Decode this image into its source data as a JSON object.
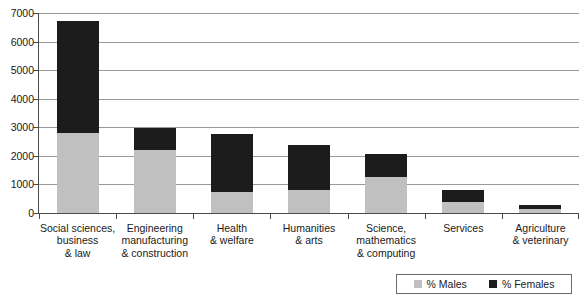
{
  "chart_data": {
    "type": "bar",
    "stacked": true,
    "title": "",
    "subtitle": "",
    "xlabel": "",
    "ylabel": "",
    "ylim": [
      0,
      7000
    ],
    "y_ticks": [
      0,
      1000,
      2000,
      3000,
      4000,
      5000,
      6000,
      7000
    ],
    "y_tick_labels": [
      "0",
      "1000",
      "2000",
      "3000",
      "4000",
      "5000",
      "6000",
      "7000"
    ],
    "grid": true,
    "grid_axis": "y",
    "legend_position": "bottom-right",
    "categories": [
      "Social sciences, business & law",
      "Engineering manufacturing & construction",
      "Health & welfare",
      "Humanities & arts",
      "Science, mathematics & computing",
      "Services",
      "Agriculture & veterinary"
    ],
    "category_label_lines": [
      [
        "Social sciences,",
        "business",
        "& law"
      ],
      [
        "Engineering",
        "manufacturing",
        "& construction"
      ],
      [
        "Health",
        "& welfare"
      ],
      [
        "Humanities",
        "& arts"
      ],
      [
        "Science,",
        "mathematics",
        "& computing"
      ],
      [
        "Services"
      ],
      [
        "Agriculture",
        "& veterinary"
      ]
    ],
    "series": [
      {
        "name": "% Males",
        "color": "#c0c0c0",
        "values": [
          2790,
          2210,
          740,
          800,
          1260,
          380,
          150
        ]
      },
      {
        "name": "% Females",
        "color": "#1c1c1c",
        "values": [
          3930,
          750,
          2040,
          1580,
          800,
          420,
          140
        ]
      }
    ],
    "totals": [
      6720,
      2960,
      2780,
      2380,
      2060,
      800,
      290
    ]
  },
  "legend": {
    "entries": [
      {
        "label": "% Males",
        "color": "#c0c0c0",
        "swatch": "square-swatch-males"
      },
      {
        "label": "% Females",
        "color": "#1c1c1c",
        "swatch": "square-swatch-females"
      }
    ]
  },
  "colors": {
    "males": "#c0c0c0",
    "females": "#1c1c1c",
    "gridline": "#9a9a9a",
    "axis": "#4a4a4a",
    "text": "#1a1a1a",
    "background": "#ffffff"
  }
}
